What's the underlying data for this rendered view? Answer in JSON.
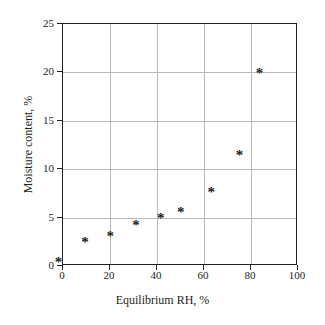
{
  "chart_data": {
    "type": "scatter",
    "title": "",
    "xlabel": "Equilibrium RH, %",
    "ylabel": "Moisture content, %",
    "xlim": [
      0,
      100
    ],
    "ylim": [
      0,
      25
    ],
    "xticks": [
      "0",
      "20",
      "40",
      "60",
      "80",
      "100"
    ],
    "yticks": [
      "0",
      "5",
      "10",
      "15",
      "20",
      "25"
    ],
    "xtick_values": [
      0,
      20,
      40,
      60,
      80,
      100
    ],
    "ytick_values": [
      0,
      5,
      10,
      15,
      20,
      25
    ],
    "grid": true,
    "legend": null,
    "marker": "*",
    "marker_color": "#1a1a1a",
    "series": [
      {
        "name": "Moisture sorption",
        "points": [
          {
            "x": -1.5,
            "y": 0.8
          },
          {
            "x": 9.8,
            "y": 2.9
          },
          {
            "x": 20.5,
            "y": 3.5
          },
          {
            "x": 31.5,
            "y": 4.6
          },
          {
            "x": 42.0,
            "y": 5.4
          },
          {
            "x": 50.5,
            "y": 6.0
          },
          {
            "x": 63.5,
            "y": 8.1
          },
          {
            "x": 75.5,
            "y": 11.9
          },
          {
            "x": 84.0,
            "y": 20.4
          }
        ]
      }
    ]
  },
  "style": {
    "axis_color": "#231f20",
    "grid_color": "#b9b9b9",
    "background": "#ffffff"
  }
}
